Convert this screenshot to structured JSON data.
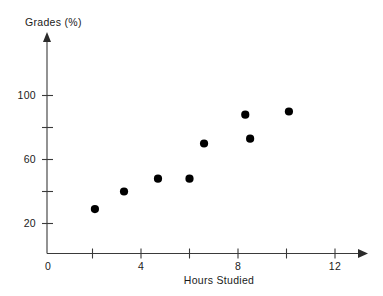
{
  "chart_data": {
    "type": "scatter",
    "title": "",
    "xlabel": "Hours Studied",
    "ylabel": "Grades (%)",
    "xlim": [
      0,
      13.3
    ],
    "ylim": [
      0,
      112
    ],
    "grid": false,
    "legend": null,
    "x_ticks": [
      {
        "value": 0,
        "label": "0"
      },
      {
        "value": 2,
        "label": ""
      },
      {
        "value": 4,
        "label": "4"
      },
      {
        "value": 6,
        "label": ""
      },
      {
        "value": 8,
        "label": "8"
      },
      {
        "value": 10,
        "label": ""
      },
      {
        "value": 12,
        "label": "12"
      }
    ],
    "y_ticks": [
      {
        "value": 20,
        "label": "20"
      },
      {
        "value": 40,
        "label": ""
      },
      {
        "value": 60,
        "label": "60"
      },
      {
        "value": 80,
        "label": ""
      },
      {
        "value": 100,
        "label": "100"
      }
    ],
    "x": [
      2.1,
      3.3,
      4.7,
      6.0,
      6.6,
      8.3,
      8.5,
      10.1
    ],
    "y": [
      29,
      40,
      48,
      48,
      70,
      88,
      73,
      90
    ],
    "points": [
      {
        "x": 2.1,
        "y": 29
      },
      {
        "x": 3.3,
        "y": 40
      },
      {
        "x": 4.7,
        "y": 48
      },
      {
        "x": 6.0,
        "y": 48
      },
      {
        "x": 6.6,
        "y": 70
      },
      {
        "x": 8.3,
        "y": 88
      },
      {
        "x": 8.5,
        "y": 73
      },
      {
        "x": 10.1,
        "y": 90
      }
    ],
    "marker": {
      "shape": "circle",
      "color": "#000000",
      "radius": 4.1
    },
    "axis_color": "#3a3a3a"
  },
  "labels": {
    "y_axis_title": "Grades (%)",
    "x_axis_title": "Hours Studied",
    "x_tick_0": "0",
    "x_tick_4": "4",
    "x_tick_8": "8",
    "x_tick_12": "12",
    "y_tick_20": "20",
    "y_tick_60": "60",
    "y_tick_100": "100"
  }
}
